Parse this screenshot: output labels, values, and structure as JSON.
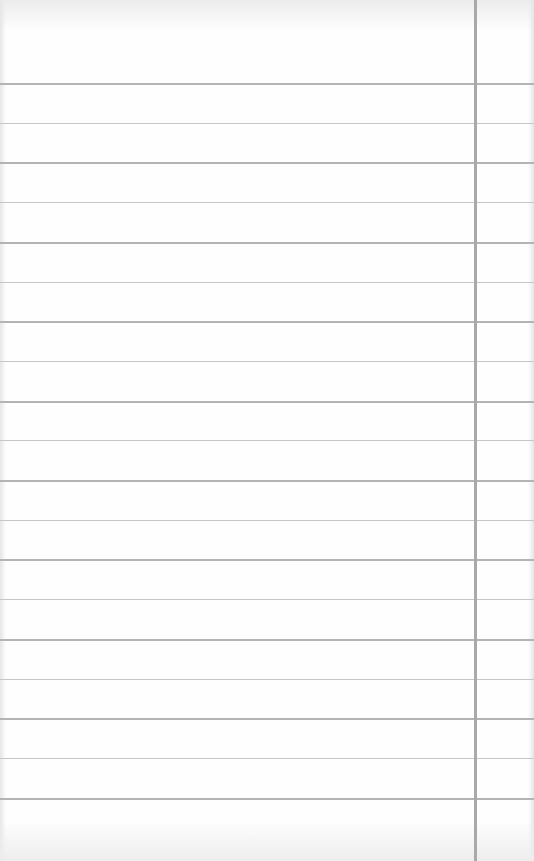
{
  "page": {
    "type": "blank lined paper",
    "rule_count": 19,
    "first_rule_y": 83,
    "rule_spacing": 39.7,
    "margin_line_x": 474,
    "colors": {
      "paper": "#fefefe",
      "rule": "#b4b4b4",
      "margin_line": "#a9a9a9"
    },
    "text": ""
  }
}
